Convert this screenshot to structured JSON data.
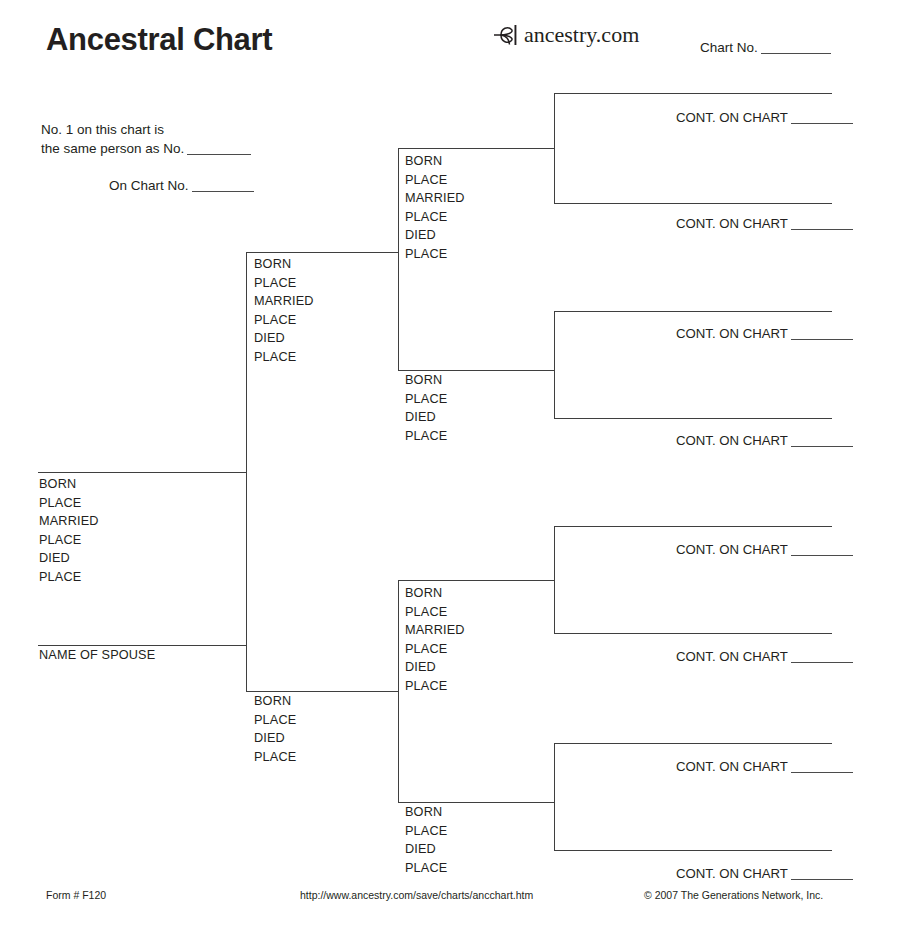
{
  "document": {
    "title": "Ancestral Chart",
    "form_label": "Form # F120",
    "url": "http://www.ancestry.com/save/charts/ancchart.htm",
    "copyright": "© 2007 The Generations Network, Inc."
  },
  "brand": {
    "name": "ancestry.com",
    "logo_icon": "ancestry-leaf-icon"
  },
  "header": {
    "chart_no_label": "Chart No."
  },
  "cross_reference": {
    "line1": "No. 1 on this chart is",
    "line2": "the same person as No.",
    "line3": "On Chart No."
  },
  "field_labels": {
    "born": "BORN",
    "place": "PLACE",
    "married": "MARRIED",
    "died": "DIED",
    "spouse": "NAME OF SPOUSE",
    "cont_on_chart": "CONT. ON CHART"
  },
  "persons": {
    "gen1": {
      "fields": [
        "BORN",
        "PLACE",
        "MARRIED",
        "PLACE",
        "DIED",
        "PLACE"
      ],
      "spouse_label": "NAME OF SPOUSE"
    },
    "gen2_father": {
      "fields": [
        "BORN",
        "PLACE",
        "MARRIED",
        "PLACE",
        "DIED",
        "PLACE"
      ]
    },
    "gen2_mother": {
      "fields": [
        "BORN",
        "PLACE",
        "DIED",
        "PLACE"
      ]
    },
    "gen3_a": {
      "fields": [
        "BORN",
        "PLACE",
        "MARRIED",
        "PLACE",
        "DIED",
        "PLACE"
      ]
    },
    "gen3_b": {
      "fields": [
        "BORN",
        "PLACE",
        "DIED",
        "PLACE"
      ]
    },
    "gen3_c": {
      "fields": [
        "BORN",
        "PLACE",
        "MARRIED",
        "PLACE",
        "DIED",
        "PLACE"
      ]
    },
    "gen3_d": {
      "fields": [
        "BORN",
        "PLACE",
        "DIED",
        "PLACE"
      ]
    }
  },
  "continuations": [
    {
      "label": "CONT. ON CHART"
    },
    {
      "label": "CONT. ON CHART"
    },
    {
      "label": "CONT. ON CHART"
    },
    {
      "label": "CONT. ON CHART"
    },
    {
      "label": "CONT. ON CHART"
    },
    {
      "label": "CONT. ON CHART"
    },
    {
      "label": "CONT. ON CHART"
    },
    {
      "label": "CONT. ON CHART"
    }
  ],
  "style": {
    "line_color": "#3f3f3f",
    "text_color": "#231f20",
    "background": "#ffffff"
  }
}
